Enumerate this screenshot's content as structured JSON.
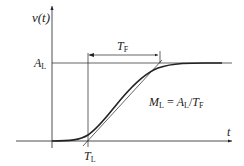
{
  "diagram": {
    "y_axis_label": "v(t)",
    "x_axis_label": "t",
    "level_label": {
      "main": "A",
      "sub": "L"
    },
    "lag_label": {
      "main": "T",
      "sub": "L"
    },
    "rise_label": {
      "main": "T",
      "sub": "F"
    },
    "formula": {
      "lhs_main": "M",
      "lhs_sub": "L",
      "eq": " = ",
      "num_main": "A",
      "num_sub": "L",
      "slash": "/",
      "den_main": "T",
      "den_sub": "F"
    },
    "colors": {
      "stroke": "#222222",
      "background": "#ffffff"
    }
  }
}
